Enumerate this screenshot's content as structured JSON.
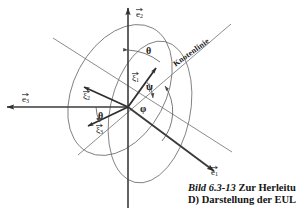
{
  "figure": {
    "title_prefix": "Bild 6.3-13",
    "title_rest": "Zur Herleitu",
    "subtitle": "D) Darstellung der EUL",
    "node_line_label": "Knotenlinie"
  },
  "axes": [
    {
      "name": "e2",
      "label_base": "e",
      "label_sub": "2",
      "description": "vertical base vector pointing up"
    },
    {
      "name": "e3",
      "label_base": "e",
      "label_sub": "3",
      "description": "horizontal base vector pointing left"
    },
    {
      "name": "e1",
      "label_base": "e",
      "label_sub": "1",
      "description": "base vector pointing lower right"
    }
  ],
  "body_vectors": [
    {
      "name": "xi1",
      "label_base": "ξ",
      "label_sub": "1",
      "description": "body axis pointing upper right"
    },
    {
      "name": "xi2",
      "label_base": "ξ",
      "label_sub": "2",
      "description": "body axis pointing upper left"
    },
    {
      "name": "xi3",
      "label_base": "ξ",
      "label_sub": "3",
      "description": "body axis pointing lower left"
    }
  ],
  "angles": [
    {
      "name": "theta-top",
      "symbol": "θ"
    },
    {
      "name": "theta-left",
      "symbol": "θ"
    },
    {
      "name": "psi",
      "symbol": "ψ"
    },
    {
      "name": "phi",
      "symbol": "φ"
    }
  ],
  "colors": {
    "line": "#3b3b3b",
    "thin_line": "#6b6b6b",
    "text": "#141414",
    "background": "#ffffff"
  }
}
